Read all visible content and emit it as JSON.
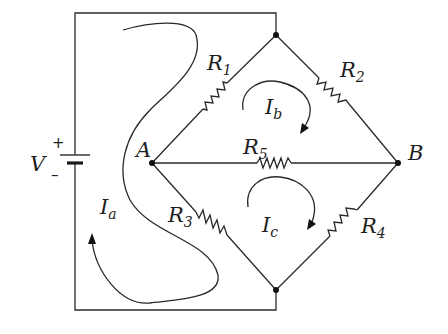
{
  "diagram": {
    "type": "circuit",
    "source": {
      "symbol": "V",
      "plus": "+",
      "minus": "–"
    },
    "nodes": {
      "A": {
        "label": "A"
      },
      "B": {
        "label": "B"
      }
    },
    "resistors": [
      {
        "base": "R",
        "sub": "1"
      },
      {
        "base": "R",
        "sub": "2"
      },
      {
        "base": "R",
        "sub": "3"
      },
      {
        "base": "R",
        "sub": "4"
      },
      {
        "base": "R",
        "sub": "5"
      }
    ],
    "mesh_currents": [
      {
        "base": "I",
        "sub": "a"
      },
      {
        "base": "I",
        "sub": "b"
      },
      {
        "base": "I",
        "sub": "c"
      }
    ],
    "colors": {
      "line": "#2a2a2a",
      "text": "#1e1e1e",
      "background": "#ffffff"
    }
  }
}
